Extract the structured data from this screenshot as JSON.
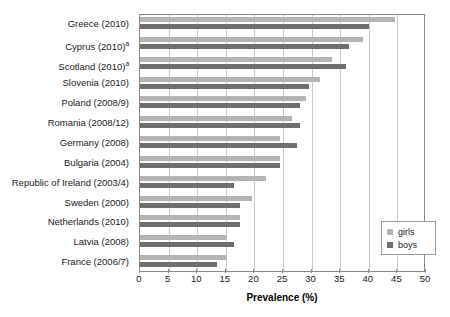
{
  "chart_data": {
    "type": "bar",
    "orientation": "horizontal",
    "title": "",
    "xlabel": "Prevalence (%)",
    "ylabel": "",
    "xlim": [
      0,
      50
    ],
    "xticks": [
      0,
      5,
      10,
      15,
      20,
      25,
      30,
      35,
      40,
      45,
      50
    ],
    "grid": true,
    "legend_position": "bottom-right",
    "categories": [
      "Greece (2010)",
      "Cyprus (2010)",
      "Scotland (2010)",
      "Slovenia (2010)",
      "Poland (2008/9)",
      "Romania (2008/12)",
      "Germany (2008)",
      "Bulgaria (2004)",
      "Republic of Ireland (2003/4)",
      "Sweden (2000)",
      "Netherlands (2010)",
      "Latvia (2008)",
      "France (2006/7)"
    ],
    "category_footnotes": [
      "",
      "a",
      "a",
      "",
      "",
      "",
      "",
      "",
      "",
      "",
      "",
      "",
      ""
    ],
    "series": [
      {
        "name": "girls",
        "color": "#b4b4b4",
        "values": [
          44.5,
          39.0,
          33.5,
          31.5,
          29.0,
          26.5,
          24.5,
          24.5,
          22.0,
          19.5,
          17.5,
          15.0,
          15.0
        ]
      },
      {
        "name": "boys",
        "color": "#6e6e6e",
        "values": [
          40.0,
          36.5,
          36.0,
          29.5,
          28.0,
          28.0,
          27.5,
          24.5,
          16.5,
          17.5,
          17.5,
          16.5,
          13.5
        ]
      }
    ]
  },
  "legend": {
    "entries": [
      {
        "label": "girls",
        "swatch": "girls"
      },
      {
        "label": "boys",
        "swatch": "boys"
      }
    ]
  }
}
